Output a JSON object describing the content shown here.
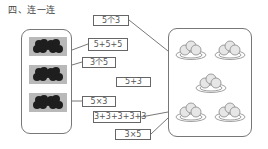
{
  "title": "四、连一连",
  "left_group": {
    "label": "grapes-pictures",
    "items": [
      {
        "name": "grapes-bunch-1"
      },
      {
        "name": "grapes-bunch-2"
      },
      {
        "name": "grapes-bunch-3"
      }
    ]
  },
  "expressions": [
    {
      "id": "e1",
      "text": "5个3"
    },
    {
      "id": "e2",
      "text": "5+5+5"
    },
    {
      "id": "e3",
      "text": "3个5"
    },
    {
      "id": "e4",
      "text": "5+3"
    },
    {
      "id": "e5",
      "text": "5×3"
    },
    {
      "id": "e6",
      "text": "3+3+3+3+3"
    },
    {
      "id": "e7",
      "text": "3×5"
    }
  ],
  "right_group": {
    "label": "plates-of-buns",
    "plate_count": 5,
    "items_per_plate": 3
  },
  "connections": [
    {
      "from": "left_group",
      "to": "5+5+5"
    },
    {
      "from": "left_group",
      "to": "3个5"
    },
    {
      "from": "left_group",
      "to": "5×3"
    },
    {
      "from": "5个3",
      "to": "right_group"
    },
    {
      "from": "3+3+3+3+3",
      "to": "right_group"
    },
    {
      "from": "3×5",
      "to": "right_group"
    }
  ],
  "colors": {
    "line": "#555555",
    "border": "#777777",
    "grape_bg": "#b9b9b9",
    "grape": "#1e1e1e"
  }
}
